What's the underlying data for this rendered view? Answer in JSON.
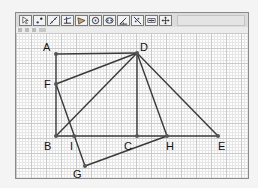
{
  "toolbar": {
    "tools": [
      {
        "name": "move-tool",
        "icon": "arrow-pointer-icon"
      },
      {
        "name": "point-tool",
        "icon": "point-icon"
      },
      {
        "name": "line-tool",
        "icon": "line-icon"
      },
      {
        "name": "perpendicular-tool",
        "icon": "perpendicular-icon"
      },
      {
        "name": "polygon-tool",
        "icon": "polygon-icon"
      },
      {
        "name": "circle-tool",
        "icon": "circle-icon"
      },
      {
        "name": "ellipse-tool",
        "icon": "conic-icon"
      },
      {
        "name": "angle-tool",
        "icon": "angle-icon"
      },
      {
        "name": "reflect-tool",
        "icon": "reflect-icon"
      },
      {
        "name": "slider-tool",
        "icon": "slider-icon"
      },
      {
        "name": "move-view-tool",
        "icon": "move-view-icon"
      }
    ]
  },
  "stylebar": {
    "items": [
      "point-style",
      "grid-toggle",
      "axes-toggle",
      "color-dropdown"
    ]
  },
  "canvas": {
    "colors": {
      "line": "#3a3a3a",
      "point": "#555555",
      "grid_major": "#c9c9c9",
      "grid_minor": "#e6e6e6"
    },
    "points": [
      {
        "label": "A",
        "x": 40,
        "y": 21,
        "lx": 27,
        "ly": 18
      },
      {
        "label": "D",
        "x": 121,
        "y": 20,
        "lx": 124,
        "ly": 18
      },
      {
        "label": "F",
        "x": 40,
        "y": 51,
        "lx": 28,
        "ly": 55
      },
      {
        "label": "B",
        "x": 40,
        "y": 103,
        "lx": 28,
        "ly": 117
      },
      {
        "label": "I",
        "x": 58,
        "y": 103,
        "lx": 54,
        "ly": 117
      },
      {
        "label": "C",
        "x": 121,
        "y": 103,
        "lx": 108,
        "ly": 117
      },
      {
        "label": "H",
        "x": 151,
        "y": 103,
        "lx": 150,
        "ly": 117
      },
      {
        "label": "E",
        "x": 202,
        "y": 103,
        "lx": 202,
        "ly": 117
      },
      {
        "label": "G",
        "x": 69,
        "y": 133,
        "lx": 57,
        "ly": 145
      }
    ],
    "segments": [
      [
        "A",
        "D"
      ],
      [
        "A",
        "B"
      ],
      [
        "B",
        "E"
      ],
      [
        "D",
        "C"
      ],
      [
        "D",
        "E"
      ],
      [
        "D",
        "B"
      ],
      [
        "D",
        "F"
      ],
      [
        "D",
        "H"
      ],
      [
        "F",
        "G"
      ],
      [
        "G",
        "H"
      ]
    ]
  }
}
